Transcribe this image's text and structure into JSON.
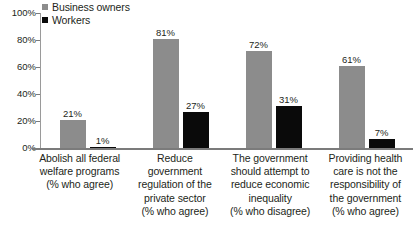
{
  "chart_data": {
    "type": "bar",
    "title": "",
    "subtitle": "",
    "xlabel": "",
    "ylabel": "",
    "ylim": [
      0,
      100
    ],
    "yticks": [
      "0%",
      "20%",
      "40%",
      "60%",
      "80%",
      "100%"
    ],
    "grid": false,
    "legend_position": "top-left",
    "colors": {
      "owners": "#8c8c8c",
      "workers": "#0a0a0a"
    },
    "legend": [
      {
        "name": "Business owners",
        "swatch": "legend-swatch-gray"
      },
      {
        "name": "Workers",
        "swatch": "legend-swatch-black"
      }
    ],
    "categories": [
      {
        "lines": [
          "Abolish all federal",
          "welfare programs",
          "(% who agree)"
        ]
      },
      {
        "lines": [
          "Reduce government",
          "regulation of the",
          "private sector",
          "(% who agree)"
        ]
      },
      {
        "lines": [
          "The government",
          "should attempt to",
          "reduce economic",
          "inequality",
          "(% who disagree)"
        ]
      },
      {
        "lines": [
          "Providing health",
          "care is not the",
          "responsibility of",
          "the government",
          "(% who agree)"
        ]
      }
    ],
    "series": [
      {
        "name": "Business owners",
        "values": [
          21,
          81,
          72,
          61
        ],
        "labels": [
          "21%",
          "81%",
          "72%",
          "61%"
        ]
      },
      {
        "name": "Workers",
        "values": [
          1,
          27,
          31,
          7
        ],
        "labels": [
          "1%",
          "27%",
          "31%",
          "7%"
        ]
      }
    ]
  }
}
